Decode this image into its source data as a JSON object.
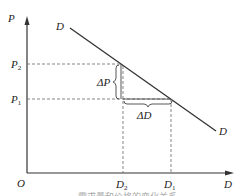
{
  "diagram": {
    "axes": {
      "y_label": "P",
      "x_label": "D",
      "origin_label": "O"
    },
    "curve": {
      "label_start": "D",
      "label_end": "D"
    },
    "y_ticks": [
      {
        "main": "P",
        "sub": "2"
      },
      {
        "main": "P",
        "sub": "1"
      }
    ],
    "x_ticks": [
      {
        "main": "D",
        "sub": "2"
      },
      {
        "main": "D",
        "sub": "1"
      }
    ],
    "annotations": {
      "delta_p": "ΔP",
      "delta_d": "ΔD"
    },
    "caption": "……需求量和价格的变化关系"
  }
}
